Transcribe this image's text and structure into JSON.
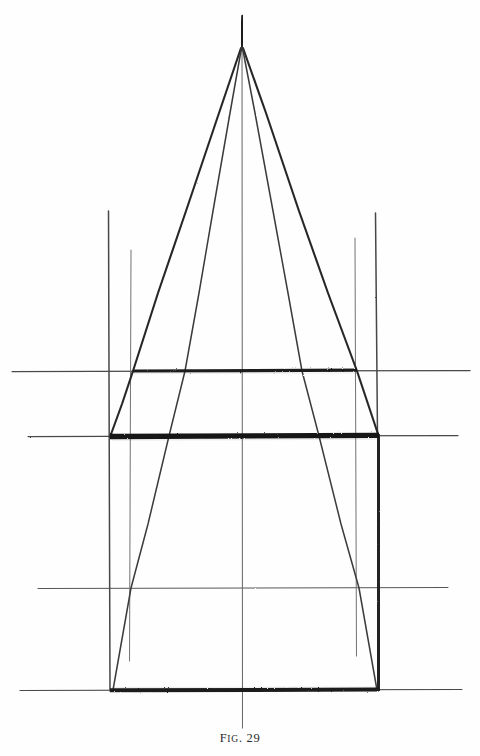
{
  "page": {
    "background_color": "#fefefe",
    "ink_color": "#2b2b2b",
    "width": 480,
    "height": 756
  },
  "caption": {
    "prefix": "F",
    "small_caps": "IG",
    "separator": ". ",
    "number": "29",
    "full_text": "FIG. 29"
  },
  "figure": {
    "title": "FIG. 29",
    "apex": {
      "x": 242,
      "y": 18
    },
    "fan_origin": {
      "x": 242,
      "y": 48
    },
    "horizontals": [
      {
        "name": "upper-guide",
        "y": 371,
        "x_start": 12,
        "x_end": 470,
        "weight": "thin",
        "bold_from": 133,
        "bold_to": 357
      },
      {
        "name": "middle-guide",
        "y": 436,
        "x_start": 28,
        "x_end": 458,
        "weight": "thin",
        "bold_from": 110,
        "bold_to": 379
      },
      {
        "name": "lower-guide",
        "y": 588,
        "x_start": 38,
        "x_end": 448,
        "weight": "thin",
        "bold_from": null,
        "bold_to": null
      },
      {
        "name": "base-line",
        "y": 690,
        "x_start": 20,
        "x_end": 462,
        "weight": "thin",
        "bold_from": 110,
        "bold_to": 379
      }
    ],
    "verticals": [
      {
        "name": "center-axis",
        "x": 242,
        "y_start": 18,
        "y_end": 728,
        "weight": "hairline"
      },
      {
        "name": "left-outer-post",
        "x": 109,
        "y_start": 211,
        "y_end": 691,
        "weight": "medium"
      },
      {
        "name": "left-inner-post",
        "x": 131,
        "y_start": 250,
        "y_end": 661,
        "weight": "faint"
      },
      {
        "name": "right-inner-post",
        "x": 355,
        "y_start": 238,
        "y_end": 656,
        "weight": "faint"
      },
      {
        "name": "right-outer-post",
        "x": 378,
        "y_start": 213,
        "y_end": 691,
        "weight": "heavy"
      }
    ],
    "diagonals": [
      {
        "name": "left-outer-ray",
        "from": {
          "x": 242,
          "y": 48
        },
        "to": {
          "x": 133,
          "y": 371
        },
        "weight": "heavy"
      },
      {
        "name": "left-outer-ray-lower",
        "from": {
          "x": 133,
          "y": 371
        },
        "to": {
          "x": 110,
          "y": 437
        },
        "weight": "heavy"
      },
      {
        "name": "left-inner-ray",
        "from": {
          "x": 242,
          "y": 48
        },
        "to": {
          "x": 185,
          "y": 371
        },
        "weight": "medium"
      },
      {
        "name": "left-inner-ray-lower",
        "from": {
          "x": 185,
          "y": 371
        },
        "to": {
          "x": 113,
          "y": 690
        },
        "weight": "medium"
      },
      {
        "name": "right-inner-ray",
        "from": {
          "x": 242,
          "y": 48
        },
        "to": {
          "x": 302,
          "y": 371
        },
        "weight": "medium"
      },
      {
        "name": "right-inner-ray-lower",
        "from": {
          "x": 302,
          "y": 371
        },
        "to": {
          "x": 378,
          "y": 690
        },
        "weight": "medium"
      },
      {
        "name": "right-outer-ray",
        "from": {
          "x": 242,
          "y": 48
        },
        "to": {
          "x": 357,
          "y": 371
        },
        "weight": "heavy"
      },
      {
        "name": "right-outer-ray-lower",
        "from": {
          "x": 357,
          "y": 371
        },
        "to": {
          "x": 379,
          "y": 437
        },
        "weight": "heavy"
      }
    ]
  }
}
